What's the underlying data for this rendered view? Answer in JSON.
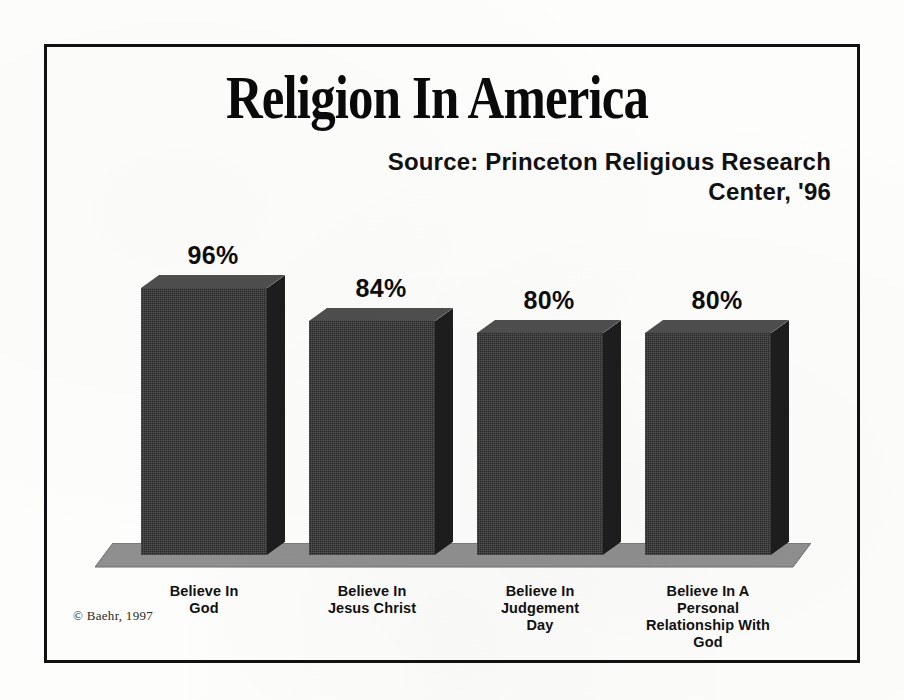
{
  "figure": {
    "title": "Religion In America",
    "source_line_1": "Source: Princeton Religious Research",
    "source_line_2": "Center, '96",
    "copyright": "© Baehr, 1997",
    "background_color": "#fdfdfc",
    "frame_color": "#111111",
    "bar_front_color": "#2a2a2a",
    "bar_top_color": "#4e4e4e",
    "bar_side_color": "#1d1d1d",
    "floor_color": "#8f8f8f"
  },
  "chart_data": {
    "type": "bar",
    "title": "Religion In America",
    "subtitle": "Source: Princeton Religious Research Center, '96",
    "xlabel": "",
    "ylabel": "",
    "ylim": [
      0,
      100
    ],
    "grid": false,
    "legend": "none",
    "style": "3d-bar",
    "value_suffix": "%",
    "categories": [
      "Believe In God",
      "Believe In Jesus Christ",
      "Believe In Judgement Day",
      "Believe In A Personal Relationship With God"
    ],
    "category_lines": [
      [
        "Believe In",
        "God"
      ],
      [
        "Believe In",
        "Jesus Christ"
      ],
      [
        "Believe In",
        "Judgement",
        "Day"
      ],
      [
        "Believe In A",
        "Personal",
        "Relationship With",
        "God"
      ]
    ],
    "values": [
      96,
      84,
      80,
      80
    ],
    "value_labels": [
      "96%",
      "84%",
      "80%",
      "80%"
    ],
    "annotations": [
      "© Baehr, 1997"
    ]
  },
  "bars": [
    {
      "label_lines": "Believe In\nGod",
      "value_label": "96%",
      "value": 96
    },
    {
      "label_lines": "Believe In\nJesus Christ",
      "value_label": "84%",
      "value": 84
    },
    {
      "label_lines": "Believe In\nJudgement\nDay",
      "value_label": "80%",
      "value": 80
    },
    {
      "label_lines": "Believe In A\nPersonal\nRelationship With\nGod",
      "value_label": "80%",
      "value": 80
    }
  ]
}
